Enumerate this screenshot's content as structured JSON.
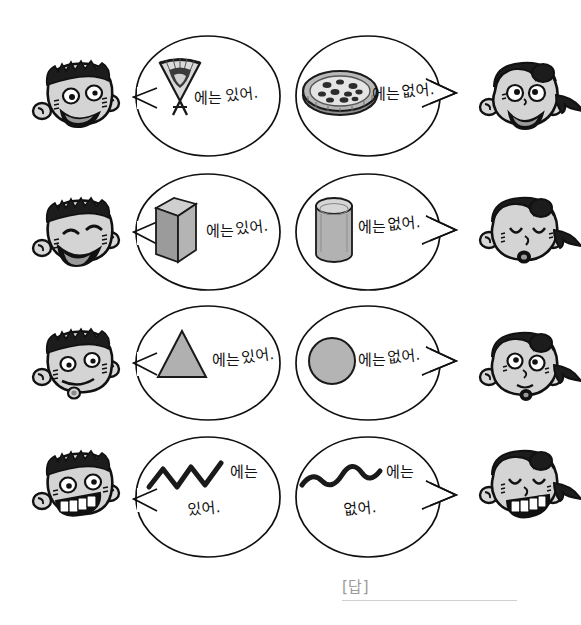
{
  "page": {
    "background_color": "#ffffff",
    "ink_color": "#1a1a1a",
    "shape_fill": "#a8a8a8",
    "shape_fill_light": "#c8c8c8",
    "shape_fill_dark": "#8a8a8a",
    "answer_rule_color": "#cfcfcf"
  },
  "rows": [
    {
      "id": "row-1",
      "left_speaker": "boy-smiling",
      "right_speaker": "girl-laughing",
      "left_bubble": {
        "object": "korean-folding-fan",
        "object_label": "부채",
        "text": "에는 있어.",
        "particle": "에는",
        "verb": "있어."
      },
      "right_bubble": {
        "object": "pizza",
        "object_label": "피자",
        "text": "에는 없어.",
        "particle": "에는",
        "verb": "없어."
      }
    },
    {
      "id": "row-2",
      "left_speaker": "boy-happy-eyes-closed",
      "right_speaker": "girl-eyes-closed",
      "left_bubble": {
        "object": "rectangular-prism",
        "object_label": "직육면체",
        "text": "에는 있어.",
        "particle": "에는",
        "verb": "있어."
      },
      "right_bubble": {
        "object": "cylinder",
        "object_label": "원기둥",
        "text": "에는 없어.",
        "particle": "에는",
        "verb": "없어."
      }
    },
    {
      "id": "row-3",
      "left_speaker": "boy-smirking",
      "right_speaker": "girl-puzzled",
      "left_bubble": {
        "object": "triangle",
        "object_label": "삼각형",
        "text": "에는 있어.",
        "particle": "에는",
        "verb": "있어."
      },
      "right_bubble": {
        "object": "circle",
        "object_label": "원",
        "text": "에는 없어.",
        "particle": "에는",
        "verb": "없어."
      }
    },
    {
      "id": "row-4",
      "left_speaker": "boy-grinning-teeth",
      "right_speaker": "girl-grinning-teeth",
      "left_bubble": {
        "object": "zigzag-line",
        "object_label": "지그재그 선",
        "text": "에는 있어.",
        "particle": "에는",
        "verb": "있어."
      },
      "right_bubble": {
        "object": "wavy-line",
        "object_label": "곡선",
        "text": "에는 없어.",
        "particle": "에는",
        "verb": "없어."
      }
    }
  ],
  "answer": {
    "label": "[답]",
    "value": ""
  }
}
